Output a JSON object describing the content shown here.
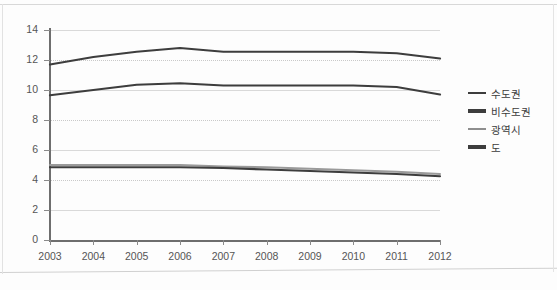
{
  "chart_data": {
    "type": "line",
    "title": "",
    "xlabel": "",
    "ylabel": "",
    "x": [
      "2003",
      "2004",
      "2005",
      "2006",
      "2007",
      "2008",
      "2009",
      "2010",
      "2011",
      "2012"
    ],
    "xlim": [
      2003,
      2012
    ],
    "ylim": [
      0,
      14
    ],
    "yticks": [
      "0",
      "2",
      "4",
      "6",
      "8",
      "10",
      "12",
      "14"
    ],
    "grid": "horizontal",
    "legend_position": "right",
    "series": [
      {
        "name": "수도권",
        "color": "#3d3d3d",
        "width": 2.2,
        "values": [
          11.7,
          12.2,
          12.55,
          12.8,
          12.55,
          12.55,
          12.55,
          12.55,
          12.45,
          12.1
        ]
      },
      {
        "name": "비수도권",
        "color": "#3d3d3d",
        "width": 2.2,
        "values": [
          9.65,
          10.0,
          10.35,
          10.45,
          10.3,
          10.3,
          10.3,
          10.3,
          10.2,
          9.7
        ]
      },
      {
        "name": "광역시",
        "color": "#9a9a9a",
        "width": 2.0,
        "values": [
          5.0,
          5.0,
          5.0,
          5.0,
          4.9,
          4.85,
          4.75,
          4.65,
          4.55,
          4.4
        ]
      },
      {
        "name": "도",
        "color": "#3d3d3d",
        "width": 2.2,
        "values": [
          4.85,
          4.85,
          4.85,
          4.85,
          4.8,
          4.7,
          4.6,
          4.5,
          4.4,
          4.25
        ]
      }
    ]
  },
  "axes": {
    "y_labels": [
      "14",
      "12",
      "10",
      "8",
      "6",
      "4",
      "2",
      "0"
    ],
    "x_labels": [
      "2003",
      "2004",
      "2005",
      "2006",
      "2007",
      "2008",
      "2009",
      "2010",
      "2011",
      "2012"
    ]
  },
  "legend": {
    "items": [
      {
        "label": "수도권",
        "color": "#3d3d3d"
      },
      {
        "label": "비수도권",
        "color": "#3d3d3d"
      },
      {
        "label": "광역시",
        "color": "#8e8e8e"
      },
      {
        "label": "도",
        "color": "#3d3d3d"
      }
    ]
  },
  "colors": {
    "background": "#fdfdfd",
    "grid": "#d9d9d9",
    "axis": "#6e6e6e",
    "text": "#555555"
  }
}
